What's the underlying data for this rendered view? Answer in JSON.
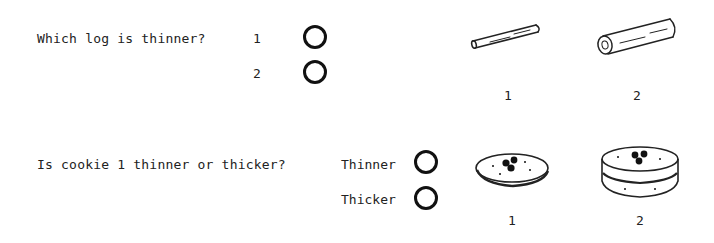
{
  "questions": [
    {
      "text": "Which log is thinner?",
      "options": [
        "1",
        "2"
      ],
      "images": [
        {
          "icon": "thin-log-icon",
          "label": "1"
        },
        {
          "icon": "thick-log-icon",
          "label": "2"
        }
      ]
    },
    {
      "text": "Is cookie 1 thinner or thicker?",
      "options": [
        "Thinner",
        "Thicker"
      ],
      "images": [
        {
          "icon": "thin-cookie-icon",
          "label": "1"
        },
        {
          "icon": "thick-cookie-icon",
          "label": "2"
        }
      ]
    }
  ]
}
